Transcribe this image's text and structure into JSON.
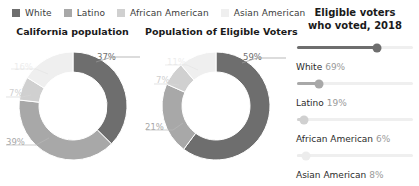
{
  "legend": {
    "items": [
      {
        "label": "White",
        "color": "#6e6e6e",
        "icon": "legend-swatch-icon"
      },
      {
        "label": "Latino",
        "color": "#a8a8a8",
        "icon": "legend-swatch-icon"
      },
      {
        "label": "African American",
        "color": "#d0d0d0",
        "icon": "legend-swatch-icon"
      },
      {
        "label": "Asian American",
        "color": "#efefef",
        "icon": "legend-swatch-icon"
      }
    ]
  },
  "chart_data": [
    {
      "type": "pie",
      "title": "California population",
      "categories": [
        "White",
        "Latino",
        "African American",
        "Asian American"
      ],
      "values": [
        37,
        39,
        7,
        16
      ],
      "labels": [
        "37%",
        "39%",
        "7%",
        "16%"
      ],
      "colors": [
        "#6e6e6e",
        "#a8a8a8",
        "#d0d0d0",
        "#efefef"
      ],
      "xlabel": "",
      "ylabel": "",
      "legend_position": "top",
      "grid": false,
      "donut": true
    },
    {
      "type": "pie",
      "title": "Population of Eligible Voters",
      "categories": [
        "White",
        "Latino",
        "African American",
        "Asian American"
      ],
      "values": [
        59,
        21,
        7,
        11
      ],
      "labels": [
        "59%",
        "21%",
        "7%",
        "11%"
      ],
      "colors": [
        "#6e6e6e",
        "#a8a8a8",
        "#d0d0d0",
        "#efefef"
      ],
      "xlabel": "",
      "ylabel": "",
      "legend_position": "top",
      "grid": false,
      "donut": true
    },
    {
      "type": "bar",
      "title": "Eligible voters who voted, 2018",
      "title_line1": "Eligible voters",
      "title_line2": "who voted, 2018",
      "categories": [
        "White",
        "Latino",
        "African American",
        "Asian American"
      ],
      "values": [
        69,
        19,
        6,
        8
      ],
      "labels": [
        "69%",
        "19%",
        "6%",
        "8%"
      ],
      "colors": [
        "#6e6e6e",
        "#a8a8a8",
        "#d0d0d0",
        "#efefef"
      ],
      "xlabel": "",
      "ylabel": "",
      "xlim": [
        0,
        100
      ],
      "grid": false,
      "orientation": "horizontal"
    }
  ]
}
